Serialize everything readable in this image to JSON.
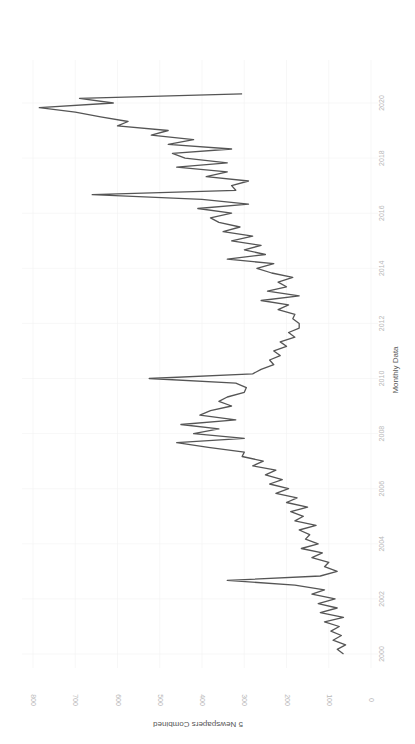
{
  "chart_data": {
    "type": "line",
    "orientation": "rotated 90 degrees clockwise (y-axis along bottom, x-axis along right edge)",
    "title": "",
    "xlabel": "Monthly Data",
    "ylabel": "5 Newspapers Combined",
    "xlim": [
      1999.7,
      2020.6
    ],
    "ylim": [
      0,
      800
    ],
    "x_ticks": [
      "2000",
      "2002",
      "2004",
      "2006",
      "2008",
      "2010",
      "2012",
      "2014",
      "2016",
      "2018",
      "2020"
    ],
    "y_ticks": [
      "0",
      "100",
      "200",
      "300",
      "400",
      "500",
      "600",
      "700",
      "800"
    ],
    "grid": true,
    "legend": null,
    "series": [
      {
        "name": "5 Newspapers Combined",
        "color": "#555555",
        "x": [
          2000.0,
          2000.17,
          2000.33,
          2000.5,
          2000.67,
          2000.83,
          2001.0,
          2001.17,
          2001.33,
          2001.5,
          2001.67,
          2001.83,
          2002.0,
          2002.17,
          2002.33,
          2002.5,
          2002.67,
          2002.83,
          2003.0,
          2003.17,
          2003.33,
          2003.5,
          2003.67,
          2003.83,
          2004.0,
          2004.17,
          2004.33,
          2004.5,
          2004.67,
          2004.83,
          2005.0,
          2005.17,
          2005.33,
          2005.5,
          2005.67,
          2005.83,
          2006.0,
          2006.17,
          2006.33,
          2006.5,
          2006.67,
          2006.83,
          2007.0,
          2007.17,
          2007.33,
          2007.5,
          2007.67,
          2007.83,
          2008.0,
          2008.17,
          2008.33,
          2008.5,
          2008.67,
          2008.83,
          2009.0,
          2009.17,
          2009.33,
          2009.5,
          2009.67,
          2009.83,
          2010.0,
          2010.17,
          2010.33,
          2010.5,
          2010.67,
          2010.83,
          2011.0,
          2011.17,
          2011.33,
          2011.5,
          2011.67,
          2011.83,
          2012.0,
          2012.17,
          2012.33,
          2012.5,
          2012.67,
          2012.83,
          2013.0,
          2013.17,
          2013.33,
          2013.5,
          2013.67,
          2013.83,
          2014.0,
          2014.17,
          2014.33,
          2014.5,
          2014.67,
          2014.83,
          2015.0,
          2015.17,
          2015.33,
          2015.5,
          2015.67,
          2015.83,
          2016.0,
          2016.17,
          2016.33,
          2016.5,
          2016.67,
          2016.83,
          2017.0,
          2017.17,
          2017.33,
          2017.5,
          2017.67,
          2017.83,
          2018.0,
          2018.17,
          2018.33,
          2018.5,
          2018.67,
          2018.83,
          2019.0,
          2019.17,
          2019.33,
          2019.5,
          2019.67,
          2019.83,
          2020.0,
          2020.17,
          2020.33
        ],
        "values": [
          65,
          80,
          60,
          90,
          70,
          95,
          75,
          110,
          65,
          120,
          80,
          125,
          85,
          140,
          110,
          180,
          340,
          120,
          80,
          110,
          100,
          140,
          115,
          165,
          125,
          155,
          145,
          170,
          130,
          180,
          160,
          190,
          150,
          200,
          175,
          225,
          195,
          240,
          210,
          250,
          225,
          280,
          255,
          305,
          300,
          385,
          460,
          300,
          420,
          360,
          450,
          320,
          405,
          380,
          330,
          360,
          340,
          300,
          295,
          320,
          525,
          280,
          260,
          230,
          240,
          215,
          230,
          200,
          215,
          180,
          195,
          170,
          170,
          185,
          180,
          220,
          195,
          260,
          170,
          245,
          200,
          220,
          185,
          235,
          270,
          230,
          340,
          250,
          300,
          260,
          330,
          280,
          350,
          310,
          360,
          380,
          330,
          410,
          290,
          400,
          660,
          320,
          330,
          290,
          390,
          340,
          460,
          340,
          440,
          470,
          330,
          480,
          420,
          520,
          480,
          600,
          575,
          640,
          700,
          785,
          610,
          690,
          305
        ]
      }
    ]
  }
}
